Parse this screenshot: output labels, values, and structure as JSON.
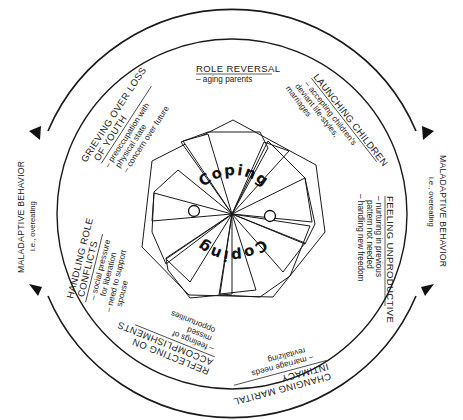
{
  "diagram": {
    "center_label": "Coping",
    "center_label_mirrored": "Coping",
    "outer_ring": {
      "left": {
        "title": "MALADAPTIVE BEHAVIOR",
        "subtitle": "i.e., overeating"
      },
      "right": {
        "title": "MALADAPTIVE BEHAVIOR",
        "subtitle": "i.e., overeating"
      }
    },
    "sections": [
      {
        "id": "role-reversal",
        "title": "ROLE REVERSAL",
        "details": [
          "– aging parents"
        ]
      },
      {
        "id": "launching-children",
        "title": "LAUNCHING CHILDREN",
        "details": [
          "– accepting children's",
          "deviant life-styles,",
          "marriages"
        ]
      },
      {
        "id": "feeling-unproductive",
        "title": "FEELING UNPRODUCTIVE",
        "details": [
          "– nurturing in previous",
          "pattern not needed",
          "– handling new freedom"
        ]
      },
      {
        "id": "changing-marital-intimacy",
        "title_lines": [
          "CHANGING MARITAL",
          "INTIMACY"
        ],
        "details": [
          "– marriage needs",
          "revitalizing"
        ]
      },
      {
        "id": "reflecting-on-accomplishments",
        "title_lines": [
          "REFLECTING ON",
          "ACCOMPLISHMENTS"
        ],
        "details": [
          "– feelings of",
          "missed",
          "opportunities"
        ]
      },
      {
        "id": "handling-role-conflicts",
        "title_lines": [
          "HANDLING ROLE",
          "CONFLICTS"
        ],
        "details": [
          "– social pressure",
          "for liberation",
          "– need to support",
          "spouse"
        ]
      },
      {
        "id": "grieving-over-loss-of-youth",
        "title_lines": [
          "GRIEVING OVER LOSS",
          "OF YOUTH"
        ],
        "details": [
          "– preoccupation with",
          "physical state",
          "– concern over future"
        ]
      }
    ],
    "colors": {
      "ink": "#1a1a1a",
      "background": "#ffffff"
    }
  }
}
